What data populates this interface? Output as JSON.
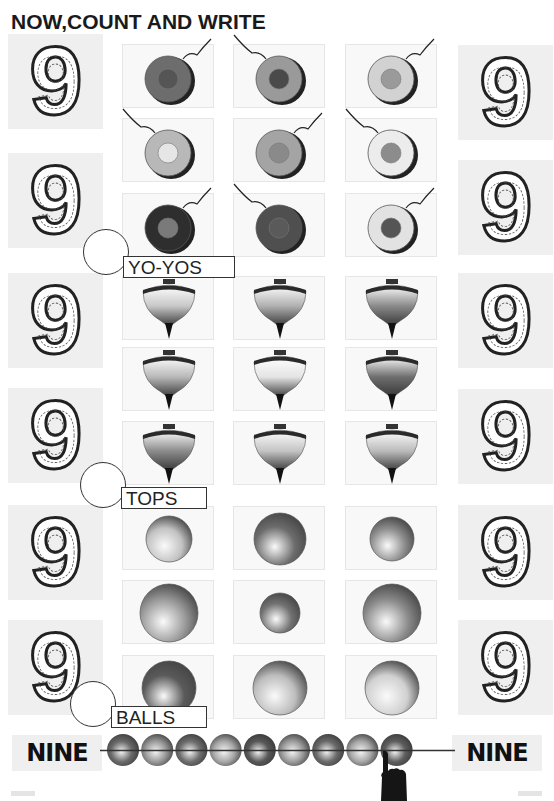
{
  "page": {
    "title": "NOW,COUNT AND WRITE"
  },
  "number_tiles": {
    "digit": "9",
    "left_count": 6,
    "right_count": 6
  },
  "sections": [
    {
      "label": "YO-YOS",
      "object": "yo-yo",
      "count": 9,
      "items": [
        {
          "row": 0,
          "col": 0,
          "body": "#6d6d6d",
          "hub": "#555",
          "string": "up-right"
        },
        {
          "row": 0,
          "col": 1,
          "body": "#9a9a9a",
          "hub": "#4a4a4a",
          "string": "up-left"
        },
        {
          "row": 0,
          "col": 2,
          "body": "#d2d2d2",
          "hub": "#9a9a9a",
          "string": "up-right"
        },
        {
          "row": 1,
          "col": 0,
          "body": "#b8b8b8",
          "hub": "#e6e6e6",
          "string": "up-left"
        },
        {
          "row": 1,
          "col": 1,
          "body": "#a4a4a4",
          "hub": "#8a8a8a",
          "string": "up-right"
        },
        {
          "row": 1,
          "col": 2,
          "body": "#ececec",
          "hub": "#8c8c8c",
          "string": "up-left"
        },
        {
          "row": 2,
          "col": 0,
          "body": "#2e2e2e",
          "hub": "#7a7a7a",
          "string": "up-right"
        },
        {
          "row": 2,
          "col": 1,
          "body": "#4f4f4f",
          "hub": "#5a5a5a",
          "string": "up-left"
        },
        {
          "row": 2,
          "col": 2,
          "body": "#e2e2e2",
          "hub": "#555",
          "string": "up-right"
        }
      ]
    },
    {
      "label": "TOPS",
      "object": "spinning-top",
      "count": 9,
      "items": [
        {
          "row": 0,
          "col": 0,
          "shade": "#c8c8c8"
        },
        {
          "row": 0,
          "col": 1,
          "shade": "#b0b0b0"
        },
        {
          "row": 0,
          "col": 2,
          "shade": "#8a8a8a"
        },
        {
          "row": 1,
          "col": 0,
          "shade": "#b8b8b8"
        },
        {
          "row": 1,
          "col": 1,
          "shade": "#e4e4e4"
        },
        {
          "row": 1,
          "col": 2,
          "shade": "#6e6e6e"
        },
        {
          "row": 2,
          "col": 0,
          "shade": "#8c8c8c"
        },
        {
          "row": 2,
          "col": 1,
          "shade": "#c4c4c4"
        },
        {
          "row": 2,
          "col": 2,
          "shade": "#bbbbbb"
        }
      ]
    },
    {
      "label": "BALLS",
      "object": "ball",
      "count": 9,
      "items": [
        {
          "row": 0,
          "col": 0,
          "r": 23,
          "shade": "#c2c2c2"
        },
        {
          "row": 0,
          "col": 1,
          "r": 26,
          "shade": "#6c6c6c"
        },
        {
          "row": 0,
          "col": 2,
          "r": 22,
          "shade": "#8e8e8e"
        },
        {
          "row": 1,
          "col": 0,
          "r": 29,
          "shade": "#9a9a9a"
        },
        {
          "row": 1,
          "col": 1,
          "r": 20,
          "shade": "#727272"
        },
        {
          "row": 1,
          "col": 2,
          "r": 29,
          "shade": "#8a8a8a"
        },
        {
          "row": 2,
          "col": 0,
          "r": 27,
          "shade": "#5a5a5a"
        },
        {
          "row": 2,
          "col": 1,
          "r": 27,
          "shade": "#bdbdbd"
        },
        {
          "row": 2,
          "col": 2,
          "r": 27,
          "shade": "#d0d0d0"
        }
      ]
    }
  ],
  "footer": {
    "left_word": "NINE",
    "right_word": "NINE",
    "bead_count": 9,
    "bead_shades": [
      "#6a6a6a",
      "#9a9a9a",
      "#6e6e6e",
      "#a8a8a8",
      "#585858",
      "#9c9c9c",
      "#6a6a6a",
      "#a6a6a6",
      "#5e5e5e"
    ],
    "pointer": "hand-pointing-icon"
  }
}
